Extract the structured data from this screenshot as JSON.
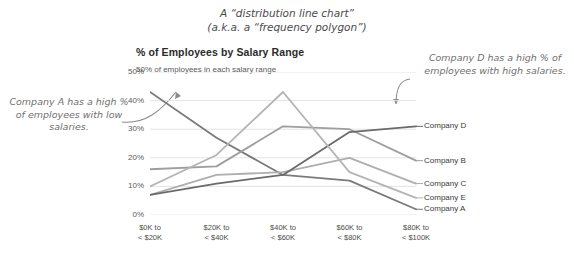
{
  "supertitle": {
    "line1": "A “distribution line chart”",
    "line2": "(a.k.a. a “frequency polygon”)"
  },
  "annotations": {
    "left": "Company A has a high % of employees with low salaries.",
    "right": "Company D has a high % of employees with high salaries."
  },
  "axis_note": "50% of employees in each salary range",
  "chart_data": {
    "type": "line",
    "title": "% of Employees by Salary Range",
    "xlabel": "",
    "ylabel": "",
    "ylim": [
      0,
      50
    ],
    "yticks": [
      "0%",
      "10%",
      "20%",
      "30%",
      "40%",
      "50%"
    ],
    "ytick_values": [
      0,
      10,
      20,
      30,
      40,
      50
    ],
    "grid": true,
    "legend_position": "right-inline",
    "categories": [
      "$0K to\n< $20K",
      "$20K to\n< $40K",
      "$40K to\n< $60K",
      "$60K to\n< $80K",
      "$80K to\n< $100K"
    ],
    "category_lines": [
      [
        "$0K to",
        "< $20K"
      ],
      [
        "$20K to",
        "< $40K"
      ],
      [
        "$40K to",
        "< $60K"
      ],
      [
        "$60K to",
        "< $80K"
      ],
      [
        "$80K to",
        "< $100K"
      ]
    ],
    "series": [
      {
        "name": "Company A",
        "values": [
          43,
          27,
          14,
          12,
          2
        ],
        "color": "#7a7a7a"
      },
      {
        "name": "Company B",
        "values": [
          16,
          17,
          31,
          30,
          19
        ],
        "color": "#9e9e9e"
      },
      {
        "name": "Company C",
        "values": [
          7,
          14,
          15,
          20,
          11
        ],
        "color": "#aeaeae"
      },
      {
        "name": "Company D",
        "values": [
          7,
          11,
          14,
          29,
          31
        ],
        "color": "#6a6a6a"
      },
      {
        "name": "Company E",
        "values": [
          10,
          21,
          43,
          15,
          6
        ],
        "color": "#b4b4b4"
      }
    ]
  }
}
